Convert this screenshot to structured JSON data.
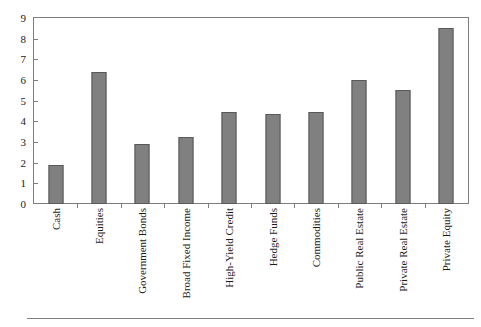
{
  "chart_data": {
    "type": "bar",
    "title": "",
    "subtitle": "",
    "xlabel": "",
    "ylabel": "",
    "ylim": [
      0,
      9
    ],
    "yticks": [
      0,
      1,
      2,
      3,
      4,
      5,
      6,
      7,
      8,
      9
    ],
    "ytick_labels": [
      "0",
      "1",
      "2",
      "3",
      "4",
      "5",
      "6",
      "7",
      "8",
      "9"
    ],
    "grid": false,
    "legend": null,
    "categories": [
      "Cash",
      "Equities",
      "Government Bonds",
      "Broad Fixed Income",
      "High-Yield Credit",
      "Hedge Funds",
      "Commodities",
      "Public Real Estate",
      "Private Real Estate",
      "Private Equity"
    ],
    "values": [
      1.9,
      6.4,
      2.9,
      3.25,
      4.45,
      4.35,
      4.45,
      6.0,
      5.5,
      8.5
    ],
    "bar_color": "#808080",
    "bar_edge_color": "#595959",
    "frame_color": "#7d7d7d",
    "background_color": "#ffffff"
  }
}
